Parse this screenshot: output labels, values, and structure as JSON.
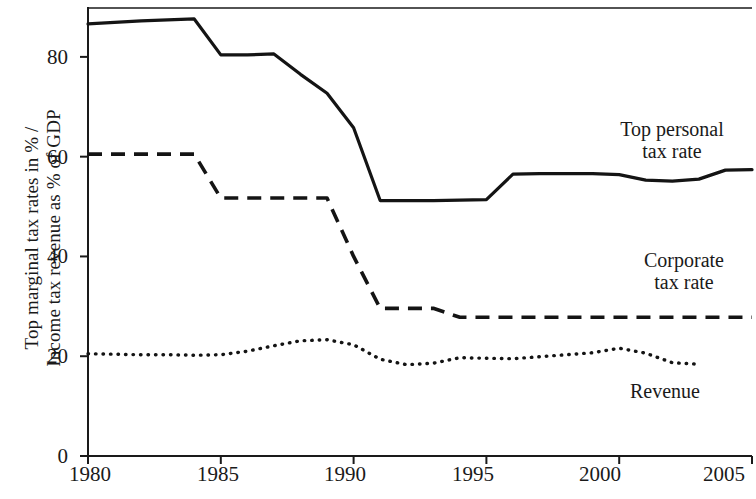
{
  "chart_data": {
    "type": "line",
    "title": "",
    "subtitle": "",
    "xlabel": "",
    "ylabel": "Top marginal tax rates in % / Income tax revenue as % of GDP",
    "ylabel_lines": [
      "Top marginal tax rates in % /",
      "Income tax revenue as % of GDP"
    ],
    "xlim": [
      1980,
      2005
    ],
    "ylim": [
      0,
      90
    ],
    "xticks": [
      1980,
      1985,
      1990,
      1995,
      2000,
      2005
    ],
    "xtick_labels": [
      "1980",
      "1985",
      "1990",
      "1995",
      "2000",
      "2005"
    ],
    "yticks": [
      0,
      20,
      40,
      60,
      80
    ],
    "ytick_labels": [
      "0",
      "20",
      "40",
      "60",
      "80"
    ],
    "grid": false,
    "legend_position": "inline-annotations",
    "line_color": "#111111",
    "x": [
      1980,
      1981,
      1982,
      1983,
      1984,
      1985,
      1986,
      1987,
      1988,
      1989,
      1990,
      1991,
      1992,
      1993,
      1994,
      1995,
      1996,
      1997,
      1998,
      1999,
      2000,
      2001,
      2002,
      2003,
      2004,
      2005
    ],
    "series": [
      {
        "name": "Top personal tax rate",
        "style": "solid",
        "label_lines": [
          "Top personal",
          "tax rate"
        ],
        "values": [
          86.6,
          86.9,
          87.2,
          87.4,
          87.6,
          80.4,
          80.4,
          80.6,
          76.5,
          72.7,
          65.8,
          51.2,
          51.2,
          51.2,
          51.3,
          51.4,
          56.5,
          56.6,
          56.6,
          56.6,
          56.4,
          55.3,
          55.1,
          55.5,
          57.3,
          57.4
        ]
      },
      {
        "name": "Corporate tax rate",
        "style": "dashed",
        "label_lines": [
          "Corporate",
          "tax rate"
        ],
        "values": [
          60.5,
          60.5,
          60.5,
          60.5,
          60.5,
          51.7,
          51.7,
          51.7,
          51.7,
          51.7,
          40.0,
          29.6,
          29.6,
          29.6,
          27.8,
          27.8,
          27.8,
          27.8,
          27.8,
          27.8,
          27.8,
          27.8,
          27.8,
          27.8,
          27.8,
          27.8
        ]
      },
      {
        "name": "Revenue",
        "style": "dotted",
        "label_lines": [
          "Revenue"
        ],
        "values": [
          20.5,
          20.4,
          20.3,
          20.3,
          20.2,
          20.3,
          21.0,
          22.1,
          23.1,
          23.3,
          22.3,
          19.4,
          18.3,
          18.6,
          19.7,
          19.6,
          19.5,
          19.9,
          20.3,
          20.7,
          21.6,
          20.6,
          18.7,
          18.4,
          null,
          null
        ]
      }
    ]
  },
  "axis": {
    "ylabel_line1": "Top marginal tax rates in % /",
    "ylabel_line2": "Income tax revenue as % of GDP"
  },
  "annotations": {
    "personal_line1": "Top personal",
    "personal_line2": "tax rate",
    "corporate_line1": "Corporate",
    "corporate_line2": "tax rate",
    "revenue": "Revenue"
  }
}
